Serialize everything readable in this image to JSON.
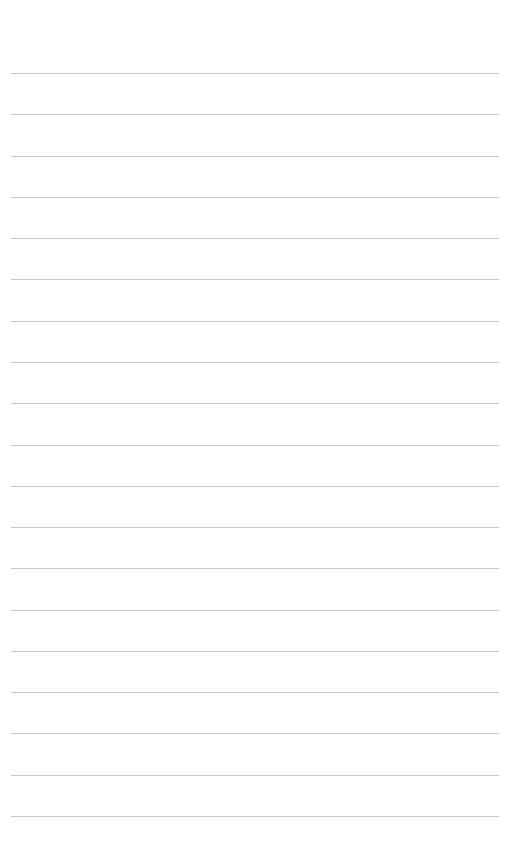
{
  "page": {
    "type": "lined-paper",
    "background": "#ffffff",
    "rule_color": "#c9c9c9",
    "rule_count": 19,
    "first_rule_y": 73,
    "rule_spacing": 41.28,
    "rule_left": 11,
    "rule_width": 488
  }
}
